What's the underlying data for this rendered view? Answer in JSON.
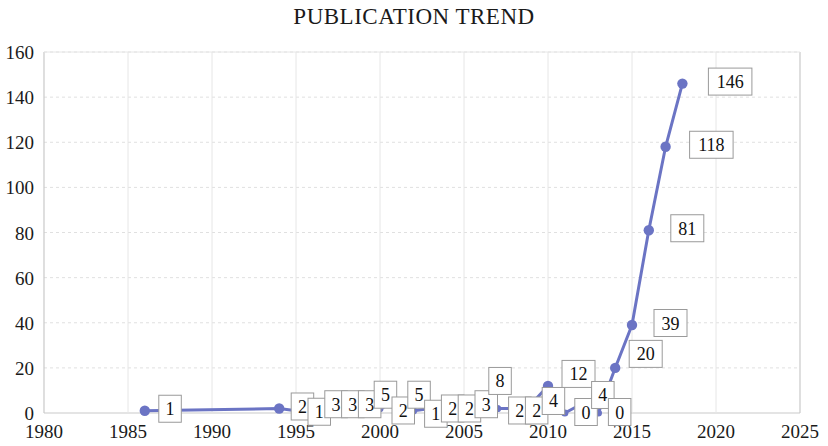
{
  "chart_data": {
    "type": "line",
    "title": "PUBLICATION TREND",
    "xlabel": "",
    "ylabel": "",
    "xlim": [
      1980,
      2025
    ],
    "ylim": [
      0,
      160
    ],
    "xticks": [
      1980,
      1985,
      1990,
      1995,
      2000,
      2005,
      2010,
      2015,
      2020,
      2025
    ],
    "yticks": [
      0,
      20,
      40,
      60,
      80,
      100,
      120,
      140,
      160
    ],
    "grid": true,
    "legend": "none",
    "series_color": "#6b74c4",
    "markers": true,
    "data_labels": true,
    "x": [
      1986,
      1994,
      1995,
      1996,
      1997,
      1998,
      1999,
      2000,
      2001,
      2002,
      2003,
      2004,
      2005,
      2006,
      2007,
      2008,
      2009,
      2010,
      2011,
      2012,
      2013,
      2014,
      2015,
      2016,
      2017,
      2018,
      2019,
      2020,
      2021,
      2022
    ],
    "values": [
      1,
      2,
      1,
      3,
      3,
      3,
      5,
      2,
      5,
      1,
      2,
      2,
      3,
      8,
      2,
      2,
      4,
      12,
      0,
      4,
      0,
      20,
      39,
      81,
      118,
      146,
      null,
      null,
      null,
      null
    ],
    "series": [
      {
        "name": "Publications",
        "points": [
          {
            "year": 1986,
            "value": 1,
            "label": "1"
          },
          {
            "year": 1994,
            "value": 2,
            "label": "2"
          },
          {
            "year": 1995,
            "value": 1,
            "label": "1"
          },
          {
            "year": 1996,
            "value": 3,
            "label": "3"
          },
          {
            "year": 1997,
            "value": 3,
            "label": "3"
          },
          {
            "year": 1998,
            "value": 3,
            "label": "3"
          },
          {
            "year": 1999,
            "value": 5,
            "label": "5"
          },
          {
            "year": 2000,
            "value": 2,
            "label": "2"
          },
          {
            "year": 2001,
            "value": 5,
            "label": "5"
          },
          {
            "year": 2002,
            "value": 1,
            "label": "1"
          },
          {
            "year": 2003,
            "value": 2,
            "label": "2"
          },
          {
            "year": 2004,
            "value": 2,
            "label": "2"
          },
          {
            "year": 2005,
            "value": 3,
            "label": "3"
          },
          {
            "year": 2006,
            "value": 8,
            "label": "8"
          },
          {
            "year": 2007,
            "value": 2,
            "label": "2"
          },
          {
            "year": 2008,
            "value": 2,
            "label": "2"
          },
          {
            "year": 2009,
            "value": 4,
            "label": "4"
          },
          {
            "year": 2010,
            "value": 12,
            "label": "12"
          },
          {
            "year": 2011,
            "value": 0,
            "label": "0"
          },
          {
            "year": 2012,
            "value": 4,
            "label": "4"
          },
          {
            "year": 2013,
            "value": 0,
            "label": "0"
          },
          {
            "year": 2014,
            "value": 20,
            "label": "20"
          },
          {
            "year": 2015,
            "value": 39,
            "label": "39"
          },
          {
            "year": 2016,
            "value": 81,
            "label": "81"
          },
          {
            "year": 2017,
            "value": 118,
            "label": "118"
          },
          {
            "year": 2018,
            "value": 146,
            "label": "146"
          }
        ]
      }
    ]
  }
}
